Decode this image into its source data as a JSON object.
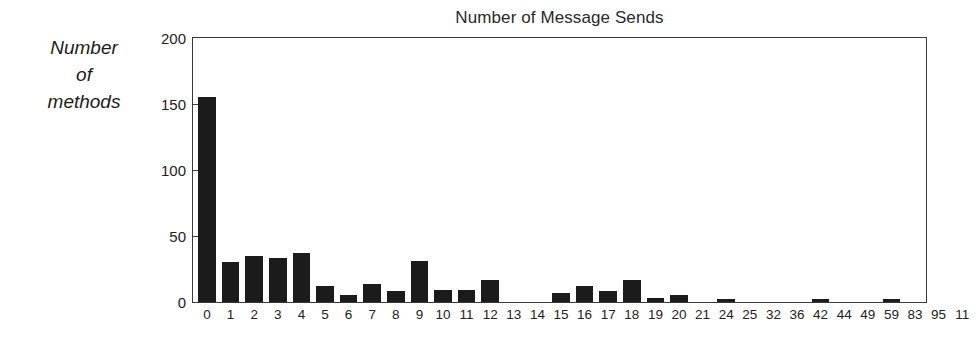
{
  "chart_data": {
    "type": "bar",
    "title": "Number of Message Sends",
    "xlabel": "",
    "ylabel": "Number of methods",
    "ylabel_lines": [
      "Number",
      "of",
      "methods"
    ],
    "categories": [
      "0",
      "1",
      "2",
      "3",
      "4",
      "5",
      "6",
      "7",
      "8",
      "9",
      "10",
      "11",
      "12",
      "13",
      "14",
      "15",
      "16",
      "17",
      "18",
      "19",
      "20",
      "21",
      "24",
      "25",
      "32",
      "36",
      "42",
      "44",
      "49",
      "59",
      "83",
      "95",
      "11",
      "12",
      "17",
      "18",
      "50"
    ],
    "values": [
      155,
      30,
      35,
      33,
      37,
      12,
      5,
      14,
      8,
      31,
      9,
      9,
      17,
      0,
      0,
      7,
      12,
      8,
      17,
      3,
      5,
      0,
      2,
      0,
      0,
      0,
      2,
      0,
      0,
      2,
      0,
      0,
      0,
      0,
      0,
      0,
      0
    ],
    "ylim": [
      0,
      200
    ],
    "xlim_note": "categorical",
    "y_ticks": [
      0,
      50,
      100,
      150,
      200
    ],
    "y_tick_labels": [
      "0",
      "50",
      "100",
      "150",
      "200"
    ],
    "grid": false,
    "legend": false,
    "legend_position": "none",
    "bar_color": "#1b1b1b",
    "axis_color": "#3a3a3a",
    "background": "#ffffff",
    "tick_direction": "in"
  }
}
